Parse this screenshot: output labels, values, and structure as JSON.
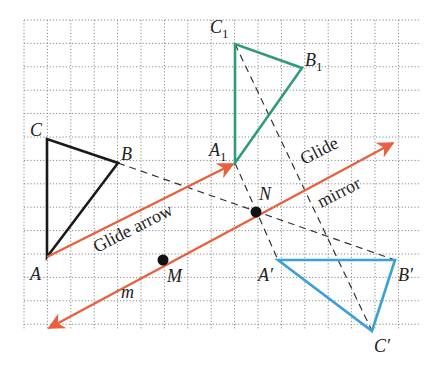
{
  "colors": {
    "grid": "#8a8a8a",
    "original": "#1a1a1a",
    "glide_image": "#2e9b7e",
    "final_image": "#3aa0d8",
    "glide": "#e8603f",
    "construction": "#333333"
  },
  "grid": {
    "left": 24,
    "top": 20,
    "right": 421,
    "bottom": 330,
    "spacing": 23.4
  },
  "points": {
    "A": {
      "label": "A",
      "x": 47,
      "y": 257
    },
    "B": {
      "label": "B",
      "x": 118,
      "y": 163
    },
    "C": {
      "label": "C",
      "x": 47,
      "y": 139
    },
    "A1": {
      "label": "A",
      "sub": "1",
      "x": 235,
      "y": 163
    },
    "B1": {
      "label": "B",
      "sub": "1",
      "x": 302,
      "y": 68
    },
    "C1": {
      "label": "C",
      "sub": "1",
      "x": 235,
      "y": 44
    },
    "A2": {
      "label": "A′",
      "x": 278,
      "y": 260
    },
    "B2": {
      "label": "B′",
      "x": 395,
      "y": 260
    },
    "C2": {
      "label": "C′",
      "x": 372,
      "y": 331
    },
    "M": {
      "label": "M",
      "x": 163,
      "y": 260
    },
    "N": {
      "label": "N",
      "x": 256,
      "y": 212
    }
  },
  "labels": {
    "glide_arrow": "Glide arrow",
    "glide": "Glide",
    "mirror": "mirror",
    "m": "m"
  }
}
